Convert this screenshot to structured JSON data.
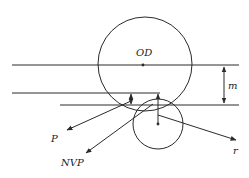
{
  "diagram": {
    "labels": {
      "od": "OD",
      "m": "m",
      "p": "P",
      "nvp": "NVP",
      "r": "r"
    },
    "colors": {
      "stroke": "#2a2a2a",
      "background": "#ffffff"
    }
  }
}
